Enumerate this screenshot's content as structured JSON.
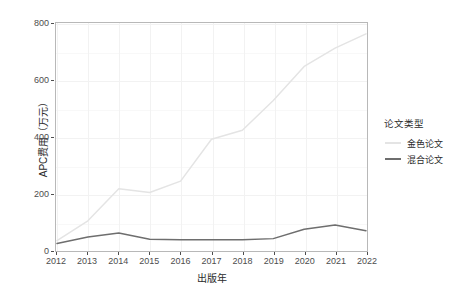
{
  "chart_data": {
    "type": "line",
    "title": "",
    "xlabel": "出版年",
    "ylabel": "APC费用（万元）",
    "categories": [
      "2012",
      "2013",
      "2014",
      "2015",
      "2016",
      "2017",
      "2018",
      "2019",
      "2020",
      "2021",
      "2022"
    ],
    "x": [
      2012,
      2013,
      2014,
      2015,
      2016,
      2017,
      2018,
      2019,
      2020,
      2021,
      2022
    ],
    "series": [
      {
        "name": "金色论文",
        "color": "#e4e4e4",
        "values": [
          35,
          105,
          218,
          205,
          245,
          393,
          425,
          530,
          650,
          715,
          765
        ]
      },
      {
        "name": "混合论文",
        "color": "#6e6e6e",
        "values": [
          25,
          48,
          62,
          40,
          38,
          38,
          38,
          42,
          75,
          90,
          70
        ]
      }
    ],
    "xlim": [
      2012,
      2022
    ],
    "ylim": [
      0,
      800
    ],
    "yticks": [
      0,
      200,
      400,
      600,
      800
    ],
    "ytick_labels": [
      "0",
      "200",
      "400",
      "600",
      "800"
    ],
    "xticks": [
      2012,
      2013,
      2014,
      2015,
      2016,
      2017,
      2018,
      2019,
      2020,
      2021,
      2022
    ],
    "xtick_labels": [
      "2012",
      "2013",
      "2014",
      "2015",
      "2016",
      "2017",
      "2018",
      "2019",
      "2020",
      "2021",
      "2022"
    ],
    "grid": true,
    "legend": {
      "title": "论文类型",
      "position": "right",
      "entries": [
        {
          "label": "金色论文",
          "color": "#e4e4e4"
        },
        {
          "label": "混合论文",
          "color": "#6e6e6e"
        }
      ]
    },
    "panel_background": "#ffffff",
    "grid_color": "#f2f2f2",
    "axis_text_color": "#4d4d4d"
  }
}
